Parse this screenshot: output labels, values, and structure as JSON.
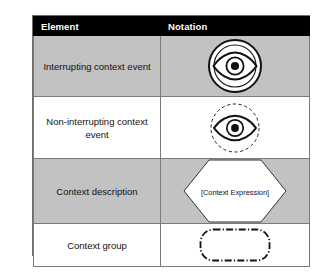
{
  "table": {
    "columns": [
      {
        "key": "element",
        "label": "Element"
      },
      {
        "key": "notation",
        "label": "Notation"
      }
    ],
    "rows": [
      {
        "element": "Interrupting context event",
        "notation_icon": "eye-in-double-solid-circle-icon",
        "notation_text": "",
        "shaded": true
      },
      {
        "element": "Non-interrupting context event",
        "notation_icon": "eye-in-dashed-circle-icon",
        "notation_text": "",
        "shaded": false
      },
      {
        "element": "Context description",
        "notation_icon": "hexagon-shape-icon",
        "notation_text": "[Context Expression]",
        "shaded": true
      },
      {
        "element": "Context group",
        "notation_icon": "dash-dot-rounded-rectangle-icon",
        "notation_text": "",
        "shaded": false
      }
    ]
  },
  "colors": {
    "header_background": "#000000",
    "header_text": "#ffffff",
    "shaded_row": "#c2c2c2",
    "plain_row": "#ffffff",
    "border": "#7a7a7a",
    "stroke": "#111111",
    "page_background": "#ffffff"
  }
}
